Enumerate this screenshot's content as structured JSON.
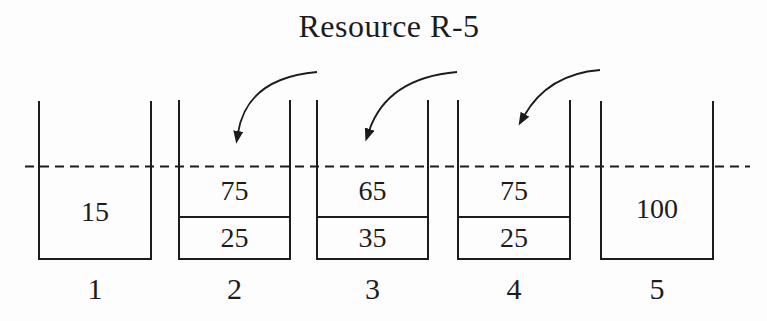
{
  "title": "Resource R-5",
  "palette": {
    "ink": "#1c1c1c",
    "background": "#fdfdfd"
  },
  "diagram": {
    "capacity_line_style": "dashed",
    "containers": [
      {
        "label": "1",
        "segments": [
          "15"
        ]
      },
      {
        "label": "2",
        "segments": [
          "75",
          "25"
        ]
      },
      {
        "label": "3",
        "segments": [
          "65",
          "35"
        ]
      },
      {
        "label": "4",
        "segments": [
          "75",
          "25"
        ]
      },
      {
        "label": "5",
        "segments": [
          "100"
        ]
      }
    ],
    "arrows": [
      {
        "points_to_container": "2"
      },
      {
        "points_to_container": "3"
      },
      {
        "points_to_container": "4"
      }
    ]
  }
}
